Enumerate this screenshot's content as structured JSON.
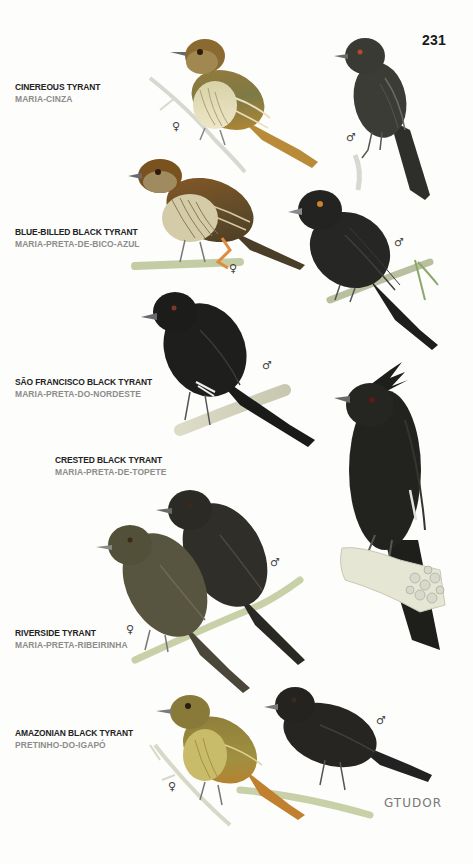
{
  "page": {
    "number": "231",
    "signature": "GTUDOR"
  },
  "species": [
    {
      "english": "CINEREOUS TYRANT",
      "portuguese": "MARIA-CINZA",
      "birds": [
        {
          "sex": "♀",
          "color": "#8a7a3c"
        },
        {
          "sex": "♂",
          "color": "#3a3a36"
        }
      ]
    },
    {
      "english": "BLUE-BILLED BLACK TYRANT",
      "portuguese": "MARIA-PRETA-DE-BICO-AZUL",
      "birds": [
        {
          "sex": "♀",
          "color": "#7a5a2a"
        },
        {
          "sex": "♂",
          "color": "#222220"
        }
      ]
    },
    {
      "english": "SÃO FRANCISCO BLACK TYRANT",
      "portuguese": "MARIA-PRETA-DO-NORDESTE",
      "birds": [
        {
          "sex": "♂",
          "color": "#1e1e1c"
        }
      ]
    },
    {
      "english": "CRESTED BLACK TYRANT",
      "portuguese": "MARIA-PRETA-DE-TOPETE",
      "birds": [
        {
          "sex": "",
          "color": "#22231f"
        }
      ]
    },
    {
      "english": "RIVERSIDE TYRANT",
      "portuguese": "MARIA-PRETA-RIBEIRINHA",
      "birds": [
        {
          "sex": "♀",
          "color": "#55523e"
        },
        {
          "sex": "♂",
          "color": "#2e2c26"
        }
      ]
    },
    {
      "english": "AMAZONIAN BLACK TYRANT",
      "portuguese": "PRETINHO-DO-IGAPÓ",
      "birds": [
        {
          "sex": "♀",
          "color": "#9a8a3a"
        },
        {
          "sex": "♂",
          "color": "#262522"
        }
      ]
    }
  ],
  "sex_symbols": {
    "female": "♀",
    "male": "♂"
  }
}
